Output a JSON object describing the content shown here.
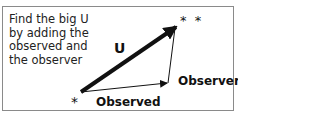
{
  "caption": "Find the big U by adding the observed and the observer",
  "labels": {
    "resultant": "U",
    "observed": "Observed",
    "observer": "Observer",
    "start_marker": "*",
    "end_marker": "* *"
  }
}
